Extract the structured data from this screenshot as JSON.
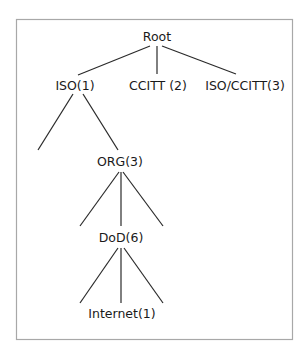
{
  "diagram": {
    "type": "tree",
    "nodes": [
      {
        "id": "root",
        "label": "Root"
      },
      {
        "id": "iso",
        "label": "ISO(1)"
      },
      {
        "id": "ccitt",
        "label": "CCITT (2)"
      },
      {
        "id": "isoccitt",
        "label": "ISO/CCITT(3)"
      },
      {
        "id": "org",
        "label": "ORG(3)"
      },
      {
        "id": "dod",
        "label": "DoD(6)"
      },
      {
        "id": "internet",
        "label": "Internet(1)"
      }
    ],
    "edges": [
      {
        "from": "root",
        "to": "iso"
      },
      {
        "from": "root",
        "to": "ccitt"
      },
      {
        "from": "root",
        "to": "isoccitt"
      },
      {
        "from": "iso",
        "to": "unlabeled-1"
      },
      {
        "from": "iso",
        "to": "org"
      },
      {
        "from": "org",
        "to": "unlabeled-2"
      },
      {
        "from": "org",
        "to": "dod"
      },
      {
        "from": "org",
        "to": "unlabeled-3"
      },
      {
        "from": "dod",
        "to": "unlabeled-4"
      },
      {
        "from": "dod",
        "to": "internet"
      },
      {
        "from": "dod",
        "to": "unlabeled-5"
      }
    ]
  }
}
